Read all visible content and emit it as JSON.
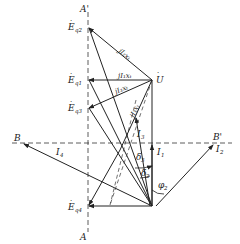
{
  "diagram": {
    "axes": {
      "vertical": {
        "top_label": "A'",
        "bottom_label": "A"
      },
      "horizontal": {
        "left_label": "B",
        "right_label": "B'"
      }
    },
    "points": {
      "U": {
        "label": "U",
        "x": 152,
        "y": 80
      },
      "O": {
        "x": 152,
        "y": 206
      },
      "Eq1": {
        "label": "E",
        "sub": "q1",
        "x": 88,
        "y": 80
      },
      "Eq2": {
        "label": "E",
        "sub": "q2",
        "x": 88,
        "y": 27
      },
      "Eq3": {
        "label": "E",
        "sub": "q3",
        "x": 88,
        "y": 108
      },
      "Eq4": {
        "label": "E",
        "sub": "q4",
        "x": 88,
        "y": 206
      },
      "B": {
        "x": 22,
        "y": 143
      },
      "Bp": {
        "x": 215,
        "y": 143
      }
    },
    "segment_labels": {
      "jI2xt": "jI₂xₜ",
      "jI1xt": "jI₁xₜ",
      "jI3xt_a": "jI₃xₜ",
      "jI3xt_b": "jI₃xₜ"
    },
    "currents": {
      "I1": {
        "label": "I",
        "sub": "1"
      },
      "I2": {
        "label": "I",
        "sub": "2"
      },
      "I3": {
        "label": "I",
        "sub": "3"
      },
      "I4": {
        "label": "I",
        "sub": "4"
      }
    },
    "angles": {
      "delta3": {
        "label": "δ",
        "sub": "3"
      },
      "delta2": {
        "label": "δ",
        "sub": "2"
      },
      "phi2": {
        "label": "φ",
        "sub": "2"
      }
    },
    "colors": {
      "line": "#222222",
      "background": "#ffffff"
    }
  }
}
